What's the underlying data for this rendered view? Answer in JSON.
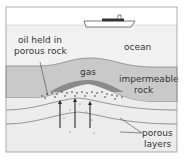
{
  "diagram": {
    "labels": {
      "oil": [
        "oil held in",
        "porous rock"
      ],
      "ocean": "ocean",
      "gas": "gas",
      "impermeable": [
        "impermeable",
        "rock"
      ],
      "porous": [
        "porous",
        "layers"
      ]
    },
    "colors": {
      "frame": "#9a9a9a",
      "sky": "#ffffff",
      "ocean": "#f1f1f1",
      "impermeable_rock": "#c9c9c9",
      "porous_layer": "#ececec",
      "gas": "#8a8a8a",
      "lines": "#6f6f6f",
      "arrows": "#2a2a2a",
      "ship": "#444444"
    },
    "arrows_count": 3
  }
}
